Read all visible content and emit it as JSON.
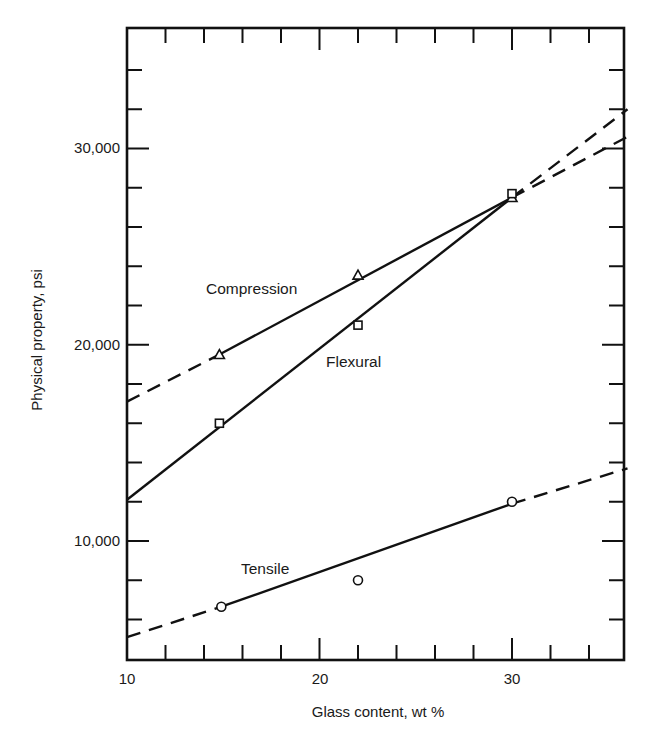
{
  "chart_data": {
    "type": "line",
    "title": "",
    "xlabel": "Glass content, wt %",
    "ylabel": "Physical property, psi",
    "xlim": [
      10,
      36
    ],
    "ylim": [
      4000,
      36000
    ],
    "x_ticks": [
      10,
      20,
      30
    ],
    "x_tick_labels": [
      "10",
      "20",
      "30"
    ],
    "y_ticks": [
      10000,
      20000,
      30000
    ],
    "y_tick_labels": [
      "10,000",
      "20,000",
      "30,000"
    ],
    "x_minor_step": 2,
    "y_minor_step": 2000,
    "grid": false,
    "legend": "inline labels",
    "series": [
      {
        "name": "Compression",
        "marker": "triangle",
        "x": [
          14.8,
          22,
          30
        ],
        "values": [
          19500,
          23550,
          27500
        ],
        "fit_line": {
          "solid_range": [
            14.8,
            30
          ],
          "dashed_extrapolation": [
            [
              10,
              17100
            ],
            [
              36,
              30600
            ]
          ]
        }
      },
      {
        "name": "Flexural",
        "marker": "square",
        "x": [
          14.8,
          22,
          30
        ],
        "values": [
          16000,
          21000,
          27700
        ],
        "fit_line": {
          "solid_range": [
            10,
            30
          ],
          "dashed_extrapolation": [
            [
              30,
              27500
            ],
            [
              36,
              32000
            ]
          ],
          "start": [
            10,
            12100
          ]
        }
      },
      {
        "name": "Tensile",
        "marker": "circle",
        "x": [
          14.9,
          22,
          30
        ],
        "values": [
          6650,
          8000,
          12000
        ],
        "fit_line": {
          "solid_range": [
            14.9,
            30
          ],
          "dashed_extrapolation": [
            [
              10,
              5100
            ],
            [
              36,
              13700
            ]
          ]
        }
      }
    ]
  },
  "labels": {
    "compression": "Compression",
    "flexural": "Flexural",
    "tensile": "Tensile",
    "xlabel": "Glass content, wt %",
    "ylabel": "Physical property, psi",
    "x10": "10",
    "x20": "20",
    "x30": "30",
    "y10000": "10,000",
    "y20000": "20,000",
    "y30000": "30,000"
  }
}
